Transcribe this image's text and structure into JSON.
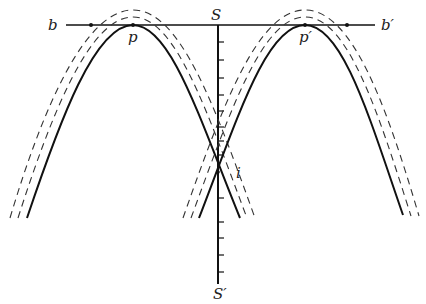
{
  "figure": {
    "type": "geometric-diagram",
    "colors": {
      "line": "#111111",
      "dash": "#333333",
      "background": "#ffffff"
    }
  },
  "labels": {
    "b": "b",
    "b_prime": "b′",
    "S": "S",
    "S_prime": "S′",
    "p": "p",
    "p_prime": "p′",
    "i": "i"
  },
  "geometry": {
    "baseline": {
      "x1": 66,
      "x2": 375,
      "y": 25
    },
    "axis": {
      "x": 218,
      "y1": 25,
      "y2": 284
    },
    "points": [
      {
        "name": "left-dot",
        "x": 91,
        "y": 25
      },
      {
        "name": "p",
        "x": 133,
        "y": 25
      },
      {
        "name": "p-prime",
        "x": 305,
        "y": 25
      },
      {
        "name": "right-dot",
        "x": 347,
        "y": 25
      }
    ],
    "tick_count_upper": 8,
    "tick_count_lower": 5
  }
}
